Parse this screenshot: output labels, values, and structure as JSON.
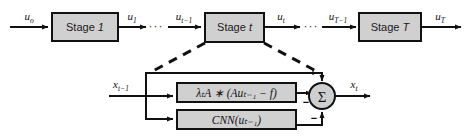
{
  "diagram": {
    "background_color": "#ffffff",
    "box_fill_color": "#d0d0d0",
    "box_stroke_color": "#111111",
    "top_row": {
      "stages": [
        {
          "label_prefix": "Stage",
          "label_index": "1",
          "name": "stage-1"
        },
        {
          "label_prefix": "Stage",
          "label_index": "t",
          "name": "stage-t"
        },
        {
          "label_prefix": "Stage",
          "label_index": "T",
          "name": "stage-T"
        }
      ],
      "signals": [
        {
          "base": "u",
          "sub": "o",
          "name": "signal-u-0"
        },
        {
          "base": "u",
          "sub": "1",
          "name": "signal-u-1"
        },
        {
          "base": "u",
          "sub": "t−1",
          "name": "signal-u-t-minus-1"
        },
        {
          "base": "u",
          "sub": "t",
          "name": "signal-u-t"
        },
        {
          "base": "u",
          "sub": "T−1",
          "name": "signal-u-T-minus-1"
        },
        {
          "base": "u",
          "sub": "T",
          "name": "signal-u-T"
        }
      ],
      "ellipses": [
        "···",
        "···"
      ]
    },
    "detail": {
      "input_label": {
        "base": "x",
        "sub": "t−1"
      },
      "output_label": {
        "base": "x",
        "sub": "t"
      },
      "blocks": [
        {
          "name": "data-fidelity-block",
          "text": "λₜA ∗ (Auₜ₋₁ − f)"
        },
        {
          "name": "cnn-block",
          "text": "CNN(uₜ₋₁)"
        }
      ],
      "summation": {
        "glyph": "Σ",
        "name": "summation-node",
        "signs": [
          {
            "name": "plus-sign-top",
            "symbol": "+",
            "port": "top"
          },
          {
            "name": "minus-sign-left",
            "symbol": "−",
            "port": "left-lower"
          },
          {
            "name": "minus-sign-bottom",
            "symbol": "−",
            "port": "bottom"
          }
        ]
      }
    }
  }
}
